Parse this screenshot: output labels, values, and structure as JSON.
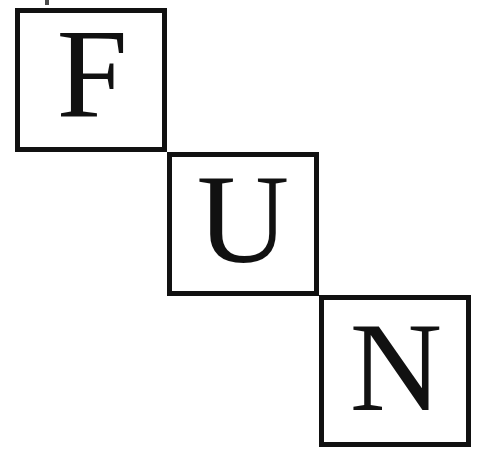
{
  "canvas": {
    "width": 487,
    "height": 460,
    "background_color": "#ffffff",
    "ink_color": "#111111"
  },
  "word": "FUN",
  "blocks": [
    {
      "letter": "F",
      "name": "letter-block-f",
      "position": "top-left",
      "x": 15,
      "y": 8,
      "width": 152,
      "height": 144,
      "border_width": 5,
      "border_color": "#111111",
      "fill_color": "#ffffff"
    },
    {
      "letter": "U",
      "name": "letter-block-u",
      "position": "middle-center",
      "x": 167,
      "y": 152,
      "width": 152,
      "height": 144,
      "border_width": 5,
      "border_color": "#111111",
      "fill_color": "#ffffff"
    },
    {
      "letter": "N",
      "name": "letter-block-n",
      "position": "bottom-right",
      "x": 319,
      "y": 295,
      "width": 152,
      "height": 152,
      "border_width": 5,
      "border_color": "#111111",
      "fill_color": "#ffffff"
    }
  ],
  "artifact": {
    "name": "scan-mark",
    "x": 45,
    "y": 0,
    "width": 4,
    "height": 5,
    "color": "#4a4a4a"
  }
}
